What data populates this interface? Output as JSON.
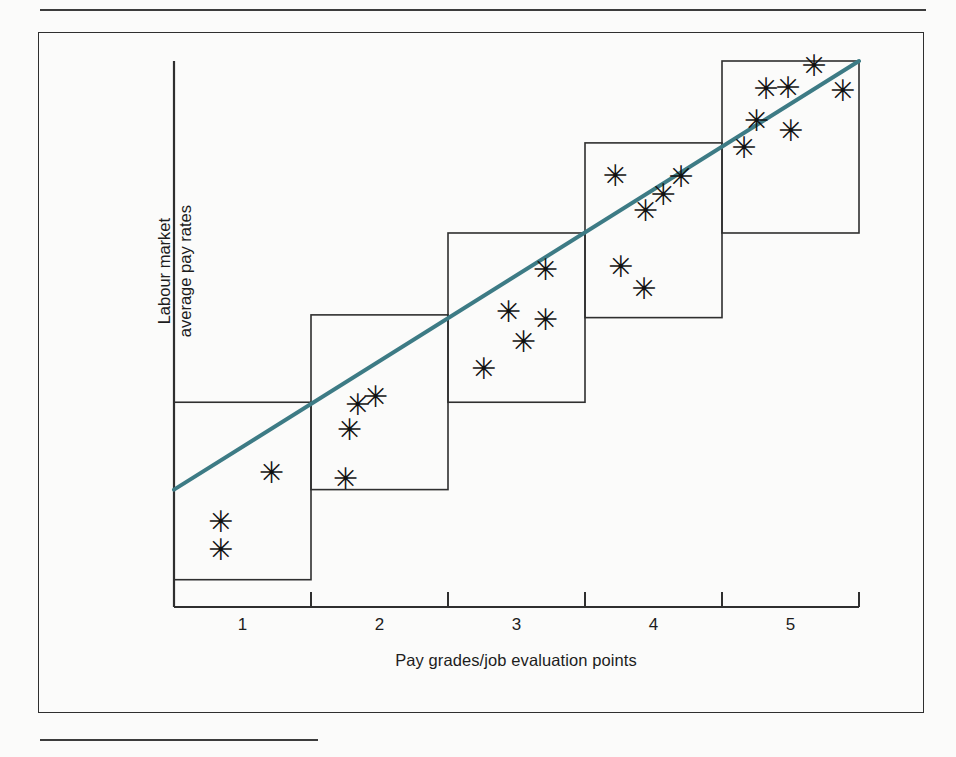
{
  "figure": {
    "background_color": "#fbfbfa",
    "frame_color": "#2f2f2f",
    "rule_color": "#3c3c3c"
  },
  "chart_data": {
    "type": "scatter",
    "title": "",
    "subtitle": "",
    "xlabel": "Pay grades/job evaluation points",
    "ylabel": "Labour market\naverage pay rates",
    "ylabel_line1": "Labour market",
    "ylabel_line2": "average pay rates",
    "categories": [
      "1",
      "2",
      "3",
      "4",
      "5"
    ],
    "tick_labels": [
      "1",
      "2",
      "3",
      "4",
      "5"
    ],
    "xlim": [
      0.5,
      5.5
    ],
    "ylim": [
      0,
      100
    ],
    "grid": false,
    "legend": "none",
    "axis_ticks_x": [
      0.5,
      1.5,
      2.5,
      3.5,
      4.5,
      5.5
    ],
    "y_axis_ticks": [],
    "marker_symbol": "✳",
    "marker_color": "#111111",
    "trend_line": {
      "name": "pay structure trend line",
      "color": "#3d7b85",
      "width": 4,
      "x_start": 0.5,
      "y_start": 21.5,
      "x_end": 5.5,
      "y_end": 100
    },
    "grade_boxes": [
      {
        "grade": "1",
        "x_min": 0.5,
        "x_max": 1.5,
        "y_min": 5.0,
        "y_max": 37.5,
        "points": 3
      },
      {
        "grade": "2",
        "x_min": 1.5,
        "x_max": 2.5,
        "y_min": 21.5,
        "y_max": 53.5,
        "points": 4
      },
      {
        "grade": "3",
        "x_min": 2.5,
        "x_max": 3.5,
        "y_min": 37.5,
        "y_max": 68.5,
        "points": 5
      },
      {
        "grade": "4",
        "x_min": 3.5,
        "x_max": 4.5,
        "y_min": 53.0,
        "y_max": 85.0,
        "points": 6
      },
      {
        "grade": "5",
        "x_min": 4.5,
        "x_max": 5.5,
        "y_min": 68.5,
        "y_max": 100.0,
        "points": 7
      }
    ],
    "series": [
      {
        "name": "Labour market average pay rates",
        "marker": "asterisk",
        "points": [
          {
            "grade": 1,
            "x": 0.84,
            "y": 15.5
          },
          {
            "grade": 1,
            "x": 0.84,
            "y": 10.5
          },
          {
            "grade": 1,
            "x": 1.21,
            "y": 24.5
          },
          {
            "grade": 2,
            "x": 1.75,
            "y": 23.5
          },
          {
            "grade": 2,
            "x": 1.78,
            "y": 32.5
          },
          {
            "grade": 2,
            "x": 1.84,
            "y": 37.0
          },
          {
            "grade": 2,
            "x": 1.97,
            "y": 38.5
          },
          {
            "grade": 3,
            "x": 2.76,
            "y": 43.5
          },
          {
            "grade": 3,
            "x": 2.94,
            "y": 54.0
          },
          {
            "grade": 3,
            "x": 3.05,
            "y": 48.5
          },
          {
            "grade": 3,
            "x": 3.21,
            "y": 52.5
          },
          {
            "grade": 3,
            "x": 3.21,
            "y": 61.8
          },
          {
            "grade": 4,
            "x": 3.72,
            "y": 79.0
          },
          {
            "grade": 4,
            "x": 3.94,
            "y": 72.5
          },
          {
            "grade": 4,
            "x": 4.07,
            "y": 75.5
          },
          {
            "grade": 4,
            "x": 4.2,
            "y": 78.7
          },
          {
            "grade": 4,
            "x": 3.76,
            "y": 62.2
          },
          {
            "grade": 4,
            "x": 3.93,
            "y": 58.2
          },
          {
            "grade": 5,
            "x": 4.66,
            "y": 84.0
          },
          {
            "grade": 5,
            "x": 4.75,
            "y": 89.0
          },
          {
            "grade": 5,
            "x": 4.82,
            "y": 94.8
          },
          {
            "grade": 5,
            "x": 4.98,
            "y": 95.0
          },
          {
            "grade": 5,
            "x": 5.0,
            "y": 87.2
          },
          {
            "grade": 5,
            "x": 5.17,
            "y": 99.0
          },
          {
            "grade": 5,
            "x": 5.38,
            "y": 94.5
          }
        ]
      }
    ]
  }
}
